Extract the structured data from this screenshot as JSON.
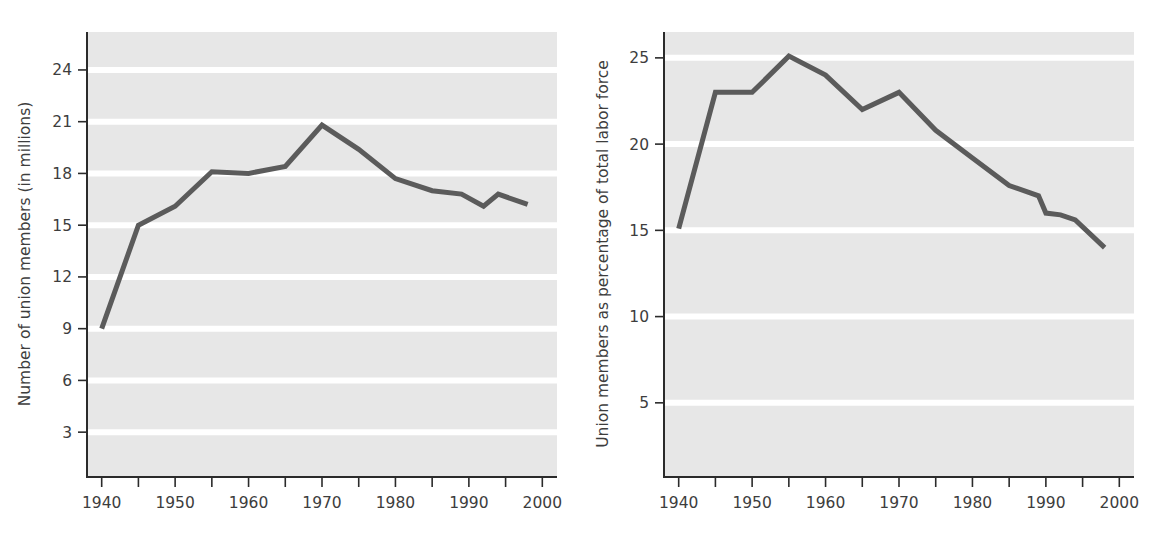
{
  "figure": {
    "background_color": "#ffffff",
    "panel_count": 2
  },
  "style": {
    "plot_bg_color": "#e7e7e7",
    "gridline_color": "#ffffff",
    "line_color": "#5b5b5b",
    "axis_color": "#2b2b2b",
    "text_color": "#3d3d3d"
  },
  "chart_data": [
    {
      "id": "left",
      "type": "line",
      "title": "",
      "subtitle": "",
      "xlabel": "",
      "ylabel": "Number of union members (in millions)",
      "xlim": [
        1938,
        2002
      ],
      "ylim": [
        0.4,
        26.2
      ],
      "grid": true,
      "grid_orientation": "horizontal",
      "legend": "none",
      "x_ticks": [
        1940,
        1950,
        1960,
        1970,
        1980,
        1990,
        2000
      ],
      "x_tick_labels": [
        "1940",
        "1950",
        "1960",
        "1970",
        "1980",
        "1990",
        "2000"
      ],
      "x_minor_ticks": [
        1940,
        1945,
        1950,
        1955,
        1960,
        1965,
        1970,
        1975,
        1980,
        1985,
        1990,
        1995,
        2000
      ],
      "y_ticks": [
        3,
        6,
        9,
        12,
        15,
        18,
        21,
        24
      ],
      "y_tick_labels": [
        "3",
        "6",
        "9",
        "12",
        "15",
        "18",
        "21",
        "24"
      ],
      "x": [
        1940,
        1945,
        1950,
        1955,
        1960,
        1965,
        1970,
        1975,
        1980,
        1985,
        1989,
        1992,
        1994,
        1998
      ],
      "values": [
        9.0,
        15.0,
        16.1,
        18.1,
        18.0,
        18.4,
        20.8,
        19.4,
        17.7,
        17.0,
        16.8,
        16.1,
        16.8,
        16.2
      ],
      "series": [
        {
          "name": "Union members (millions)",
          "values": [
            9.0,
            15.0,
            16.1,
            18.1,
            18.0,
            18.4,
            20.8,
            19.4,
            17.7,
            17.0,
            16.8,
            16.1,
            16.8,
            16.2
          ]
        }
      ],
      "annotations": []
    },
    {
      "id": "right",
      "type": "line",
      "title": "",
      "subtitle": "",
      "xlabel": "",
      "ylabel": "Union members as percentage of total labor force",
      "xlim": [
        1938,
        2002
      ],
      "ylim": [
        0.7,
        26.5
      ],
      "grid": true,
      "grid_orientation": "horizontal",
      "legend": "none",
      "x_ticks": [
        1940,
        1950,
        1960,
        1970,
        1980,
        1990,
        2000
      ],
      "x_tick_labels": [
        "1940",
        "1950",
        "1960",
        "1970",
        "1980",
        "1990",
        "2000"
      ],
      "x_minor_ticks": [
        1940,
        1945,
        1950,
        1955,
        1960,
        1965,
        1970,
        1975,
        1980,
        1985,
        1990,
        1995,
        2000
      ],
      "y_ticks": [
        5,
        10,
        15,
        20,
        25
      ],
      "y_tick_labels": [
        "5",
        "10",
        "15",
        "20",
        "25"
      ],
      "x": [
        1940,
        1945,
        1950,
        1955,
        1960,
        1965,
        1970,
        1975,
        1980,
        1985,
        1989,
        1990,
        1992,
        1994,
        1998
      ],
      "values": [
        15.1,
        23.0,
        23.0,
        25.1,
        24.0,
        22.0,
        23.0,
        20.8,
        19.2,
        17.6,
        17.0,
        16.0,
        15.9,
        15.6,
        14.0
      ],
      "series": [
        {
          "name": "Union members as % of labor force",
          "values": [
            15.1,
            23.0,
            23.0,
            25.1,
            24.0,
            22.0,
            23.0,
            20.8,
            19.2,
            17.6,
            17.0,
            16.0,
            15.9,
            15.6,
            14.0
          ]
        }
      ],
      "annotations": []
    }
  ]
}
